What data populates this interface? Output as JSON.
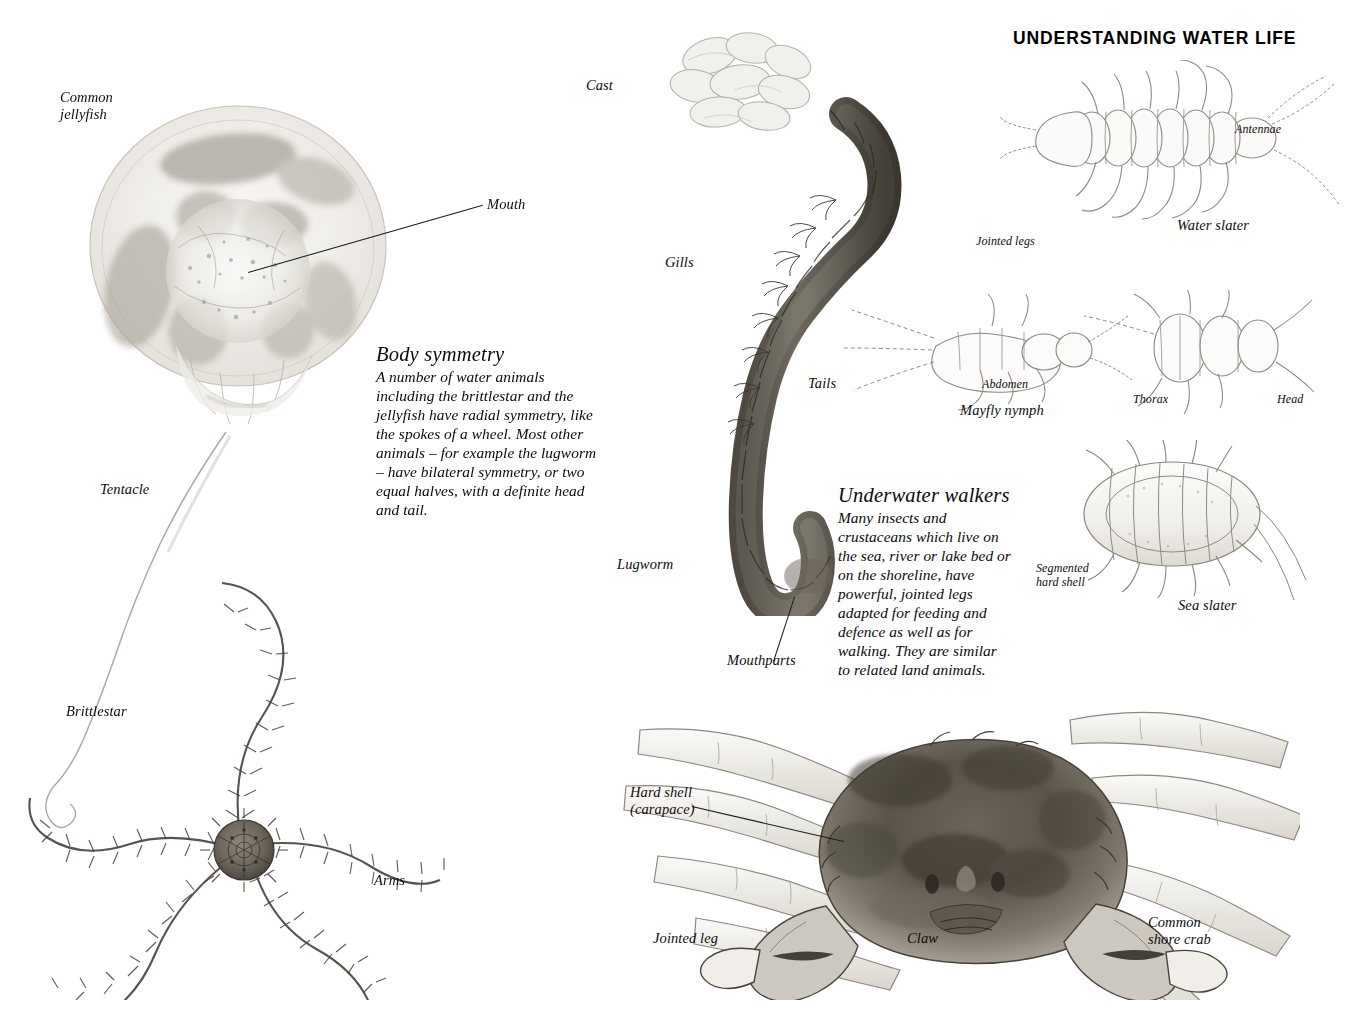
{
  "page": {
    "title": "UNDERSTANDING WATER LIFE",
    "background_color": "#ffffff",
    "ink_color": "#111111"
  },
  "text_blocks": [
    {
      "name": "body-symmetry",
      "heading": "Body symmetry",
      "body": "A number of water animals\ninkluding the brittlestar and the\njellyfish have radial symmetry, like\nthe spokes of a wheel. Most other\nanimals – for example the lugworm\n– have bilateral symmetry, or two\nequal halves, with a definite head\nand tail."
    },
    {
      "name": "underwater-walkers",
      "heading": "Underwater walkers",
      "body": "Many insects and\ncrustaceans which live on\nthe sea, river or lake bed or\non the shoreline, have\npowerful, jointed legs\nadapted for feeding and\ndefence as well as for\nwalking. They are similar\nto related land animals."
    }
  ],
  "body_symmetry_text": "A number of water animals\nincluding the brittlestar and the\njellyfish have radial symmetry, like\nthe spokes of a wheel. Most other\nanimals – for example the lugworm\n– have bilateral symmetry, or two\nequal halves, with a definite head\nand tail.",
  "specimens": {
    "jellyfish": {
      "name": "Common\njellyfish",
      "parts": {
        "mouth": "Mouth",
        "tentacle": "Tentacle"
      }
    },
    "brittlestar": {
      "name": "Brittlestar",
      "parts": {
        "arms": "Arms"
      }
    },
    "lugworm": {
      "name": "Lugworm",
      "parts": {
        "cast": "Cast",
        "gills": "Gills",
        "tails": "Tails",
        "mouthparts": "Mouthparts"
      }
    },
    "water_slater": {
      "name": "Water slater",
      "parts": {
        "antennae": "Antennae",
        "jointed_legs": "Jointed legs"
      }
    },
    "mayfly_nymph": {
      "name": "Mayfly nymph",
      "parts": {
        "abdomen": "Abdomen",
        "thorax": "Thorax",
        "head": "Head"
      }
    },
    "sea_slater": {
      "name": "Sea slater",
      "parts": {
        "segmented_hard_shell": "Segmented\nhard shell"
      }
    },
    "shore_crab": {
      "name": "Common\nshore crab",
      "parts": {
        "hard_shell": "Hard shell\n(carapace)",
        "jointed_leg": "Jointed leg",
        "claw": "Claw"
      }
    }
  }
}
